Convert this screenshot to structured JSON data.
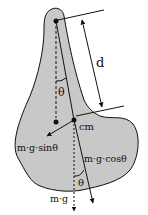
{
  "diagram": {
    "labels": {
      "distance": "d",
      "theta_top": "θ",
      "theta_bottom": "θ",
      "center_of_mass": "cm",
      "tangential_force": "m·g·sinθ",
      "radial_force": "m·g·cosθ",
      "weight": "m·g"
    },
    "colors": {
      "body_fill": "#c8c8c8",
      "stroke": "#111111",
      "background": "#ffffff"
    }
  }
}
